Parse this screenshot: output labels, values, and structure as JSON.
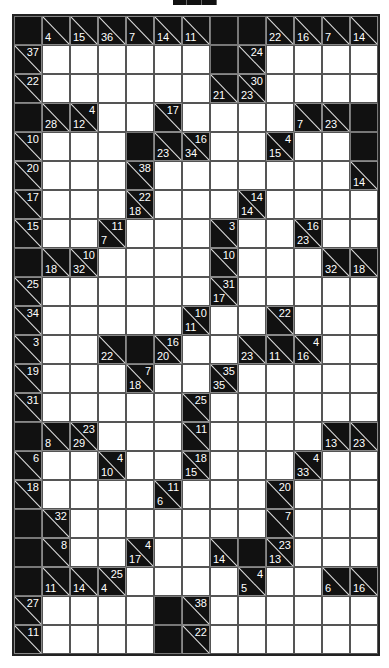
{
  "puzzle": {
    "type": "kakuro",
    "cols": 13,
    "rows": 22,
    "colors": {
      "block": "#111111",
      "white": "#ffffff",
      "grid": "#555555",
      "clue_text": "#ffffff"
    },
    "grid": [
      [
        "B",
        "d4",
        "d15",
        "d36",
        "d7",
        "d14",
        "d11",
        "B",
        "B",
        "d22",
        "d16",
        "d7",
        "d14"
      ],
      [
        "r37",
        "W",
        "W",
        "W",
        "W",
        "W",
        "W",
        "B",
        "r24",
        "W",
        "W",
        "W",
        "W"
      ],
      [
        "r22",
        "W",
        "W",
        "W",
        "W",
        "W",
        "W",
        "d21",
        "d23/r30",
        "W",
        "W",
        "W",
        "W"
      ],
      [
        "B",
        "d28",
        "d12/r4",
        "W",
        "W",
        "r17",
        "W",
        "W",
        "W",
        "W",
        "d7",
        "d23",
        "B"
      ],
      [
        "r10",
        "W",
        "W",
        "W",
        "B",
        "d23",
        "d34/r16",
        "W",
        "W",
        "d15/r4",
        "W",
        "W",
        "B"
      ],
      [
        "r20",
        "W",
        "W",
        "W",
        "r38",
        "W",
        "W",
        "W",
        "W",
        "W",
        "W",
        "W",
        "d14"
      ],
      [
        "r17",
        "W",
        "W",
        "W",
        "d18/r22",
        "W",
        "W",
        "W",
        "d14/r14",
        "W",
        "W",
        "W",
        "W"
      ],
      [
        "r15",
        "W",
        "W",
        "d7/r11",
        "W",
        "W",
        "W",
        "r3",
        "W",
        "W",
        "d23/r16",
        "W",
        "W"
      ],
      [
        "B",
        "d18",
        "d32/r10",
        "W",
        "W",
        "W",
        "W",
        "r10",
        "W",
        "W",
        "W",
        "d32",
        "d18"
      ],
      [
        "r25",
        "W",
        "W",
        "W",
        "W",
        "W",
        "W",
        "d17/r31",
        "W",
        "W",
        "W",
        "W",
        "W"
      ],
      [
        "r34",
        "W",
        "W",
        "W",
        "W",
        "W",
        "d11/r10",
        "W",
        "W",
        "r22",
        "W",
        "W",
        "W"
      ],
      [
        "r3",
        "W",
        "W",
        "d22",
        "B",
        "d20/r16",
        "W",
        "W",
        "d23",
        "d11",
        "d16/r4",
        "W",
        "W"
      ],
      [
        "r19",
        "W",
        "W",
        "W",
        "d18/r7",
        "W",
        "W",
        "d35/r35",
        "W",
        "W",
        "W",
        "W",
        "W"
      ],
      [
        "r31",
        "W",
        "W",
        "W",
        "W",
        "W",
        "r25",
        "W",
        "W",
        "W",
        "W",
        "W",
        "W"
      ],
      [
        "B",
        "d8",
        "d29/r23",
        "W",
        "W",
        "W",
        "r11",
        "W",
        "W",
        "W",
        "W",
        "d13",
        "d23"
      ],
      [
        "r6",
        "W",
        "W",
        "d10/r4",
        "W",
        "W",
        "d15/r18",
        "W",
        "W",
        "W",
        "d33/r4",
        "W",
        "W"
      ],
      [
        "r18",
        "W",
        "W",
        "W",
        "W",
        "d6/r11",
        "W",
        "W",
        "W",
        "r20",
        "W",
        "W",
        "W"
      ],
      [
        "B",
        "r32",
        "W",
        "W",
        "W",
        "W",
        "W",
        "W",
        "W",
        "r7",
        "W",
        "W",
        "W"
      ],
      [
        "B",
        "r8",
        "W",
        "W",
        "d17/r4",
        "W",
        "W",
        "d14",
        "B",
        "d13/r23",
        "W",
        "W",
        "W"
      ],
      [
        "B",
        "d11",
        "d14",
        "d4/r25",
        "W",
        "W",
        "W",
        "W",
        "d5/r4",
        "W",
        "W",
        "d6",
        "d16"
      ],
      [
        "r27",
        "W",
        "W",
        "W",
        "W",
        "B",
        "r38",
        "W",
        "W",
        "W",
        "W",
        "W",
        "W"
      ],
      [
        "r11",
        "W",
        "W",
        "W",
        "W",
        "B",
        "r22",
        "W",
        "W",
        "W",
        "W",
        "W",
        "W"
      ]
    ]
  }
}
